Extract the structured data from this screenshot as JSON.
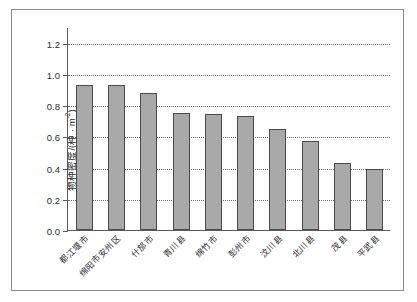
{
  "chart_data": {
    "type": "bar",
    "title": "",
    "xlabel": "",
    "ylabel": "物种密度/(种·m⁻²)",
    "ylabel_base": "物种密度/(种 · m",
    "ylabel_exp": "-2",
    "ylabel_tail": ")",
    "ylim": [
      0.0,
      1.3
    ],
    "yticks": [
      "0.0",
      "0.2",
      "0.4",
      "0.6",
      "0.8",
      "1.0",
      "1.2"
    ],
    "ytick_values": [
      0.0,
      0.2,
      0.4,
      0.6,
      0.8,
      1.0,
      1.2
    ],
    "grid": true,
    "grid_style": "dotted-horizontal",
    "legend": "none",
    "categories": [
      "都江堰市",
      "绵阳市安州区",
      "什邡市",
      "青川县",
      "绵竹市",
      "彭州市",
      "汶川县",
      "北川县",
      "茂县",
      "平武县"
    ],
    "values": [
      0.93,
      0.93,
      0.88,
      0.75,
      0.74,
      0.73,
      0.65,
      0.57,
      0.43,
      0.39
    ],
    "bar_color": "#a9a9a9",
    "bar_edge_color": "#4a4a4a",
    "axis_color": "#5a5a5a",
    "frame_color": "#8b8b8b"
  }
}
